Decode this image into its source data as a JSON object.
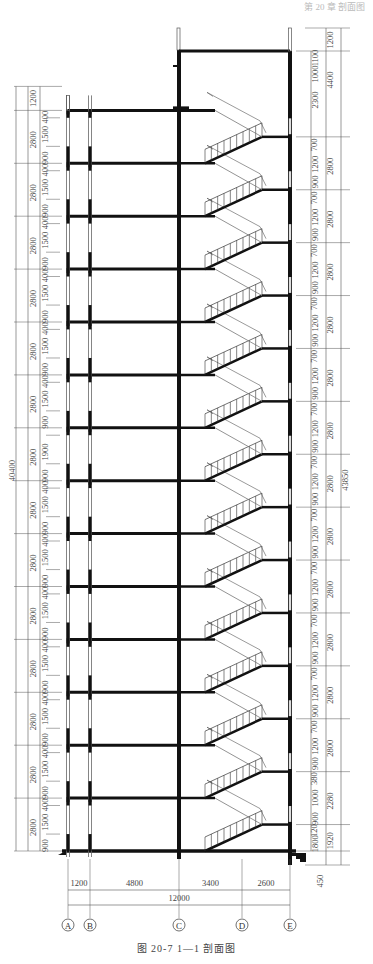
{
  "header": {
    "text": "第 20 章  剖面图"
  },
  "caption": "图 20-7   1—1 剖面图",
  "drawing": {
    "title": "1—1 剖面图",
    "figure_number": "图 20-7",
    "axes": [
      {
        "label": "A",
        "x": 68
      },
      {
        "label": "B",
        "x": 90
      },
      {
        "label": "C",
        "x": 179
      },
      {
        "label": "D",
        "x": 242
      },
      {
        "label": "E",
        "x": 290
      }
    ],
    "bottom_dimensions": {
      "segments": [
        "1200",
        "4800",
        "3400",
        "2600"
      ],
      "total": "12000"
    },
    "left_dimensions": {
      "total": "40400",
      "parapet": "1200",
      "floor_height": "2800",
      "floors": 14,
      "window_split": [
        "900",
        "1500",
        "400"
      ],
      "ground_floor_split": [
        "900",
        "1900"
      ]
    },
    "right_dimensions": {
      "total": "43850",
      "top_parapet": "1200",
      "top_storey": "4400",
      "top_splits": [
        "2300",
        "1000",
        "1100"
      ],
      "floor_height": "2800",
      "window_split": [
        "900",
        "1200",
        "700"
      ],
      "lower_split_1": [
        "900",
        "1000",
        "380"
      ],
      "lower_height_1": "2280",
      "lower_split_2": [
        "1800",
        "120"
      ],
      "lower_height_2": "1920",
      "base": "450"
    },
    "colors": {
      "line": "#1a1a1a",
      "wall": "#111111",
      "dim": "#555555",
      "window": "#9a9a9a"
    }
  }
}
